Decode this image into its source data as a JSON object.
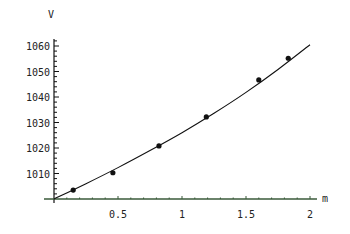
{
  "chart_data": {
    "type": "scatter",
    "title": "",
    "xlabel": "m",
    "ylabel": "V",
    "xlim": [
      0,
      2.05
    ],
    "ylim": [
      1000,
      1062
    ],
    "grid": false,
    "legend": null,
    "x_ticks": [
      0.5,
      1,
      1.5,
      2
    ],
    "x_tick_labels": [
      "0.5",
      "1",
      "1.5",
      "2"
    ],
    "y_ticks": [
      1010,
      1020,
      1030,
      1040,
      1050,
      1060
    ],
    "y_tick_labels": [
      "1010",
      "1020",
      "1030",
      "1040",
      "1050",
      "1060"
    ],
    "series": [
      {
        "name": "measured",
        "kind": "points",
        "x": [
          0.15,
          0.46,
          0.82,
          1.19,
          1.6,
          1.83
        ],
        "y": [
          1003.5,
          1010.3,
          1020.8,
          1032.2,
          1046.7,
          1055.2
        ]
      },
      {
        "name": "fit",
        "kind": "line",
        "x": [
          0.0,
          0.25,
          0.5,
          0.75,
          1.0,
          1.25,
          1.5,
          1.75,
          2.0
        ],
        "y": [
          1000.0,
          1006.0,
          1012.3,
          1019.0,
          1026.0,
          1033.6,
          1041.8,
          1050.8,
          1060.5
        ]
      }
    ]
  },
  "colors": {
    "background": "#ffffff",
    "axis_y": "#111111",
    "axis_x": "#3a5a3a",
    "line": "#111111",
    "points": "#111111"
  }
}
